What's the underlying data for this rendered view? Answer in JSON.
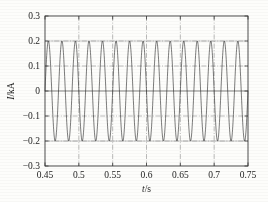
{
  "figure": {
    "background_color": "#fdfdfb",
    "trace_color": "#2a2a2a",
    "grid_color": "#8d8d8d",
    "frame_color": "#3a3a3a"
  },
  "chart_data": {
    "type": "line",
    "title": "",
    "subtitle": "",
    "xlabel": "t/s",
    "ylabel": "I/kA",
    "xlabel_symbol": "t",
    "xlabel_unit": "/s",
    "ylabel_symbol": "I",
    "ylabel_unit": "/kA",
    "xlim": [
      0.45,
      0.75
    ],
    "ylim": [
      -0.3,
      0.3
    ],
    "xticks": [
      0.45,
      0.5,
      0.55,
      0.6,
      0.65,
      0.7,
      0.75
    ],
    "xtick_labels": [
      "0.45",
      "0.5",
      "0.55",
      "0.6",
      "0.65",
      "0.7",
      "0.75"
    ],
    "yticks": [
      -0.3,
      -0.2,
      -0.1,
      0,
      0.1,
      0.2,
      0.3
    ],
    "ytick_labels": [
      "−0.3",
      "−0.2",
      "−0.1",
      "0",
      "0.1",
      "0.2",
      "0.3"
    ],
    "grid": true,
    "grid_style": "dash-dot",
    "legend": null,
    "legend_position": "none",
    "annotations": [],
    "series": [
      {
        "name": "current",
        "waveform": "sine",
        "amplitude": 0.2,
        "frequency_hz": 50,
        "phase_rad": 0,
        "offset": 0,
        "samples_per_cycle": 64,
        "description": "50 Hz sinusoidal current, peak amplitude 0.2 kA, constant over 0.45 s to 0.75 s"
      }
    ]
  }
}
